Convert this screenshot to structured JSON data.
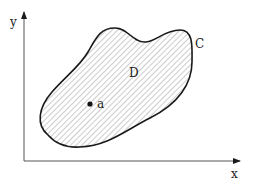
{
  "diagram": {
    "axes": {
      "x_label": "x",
      "y_label": "y"
    },
    "region": {
      "curve_label": "C",
      "region_label": "D",
      "point_label": "a"
    },
    "colors": {
      "stroke": "#1a1a1a",
      "hatch": "#9a9a9a",
      "background": "#ffffff"
    }
  }
}
